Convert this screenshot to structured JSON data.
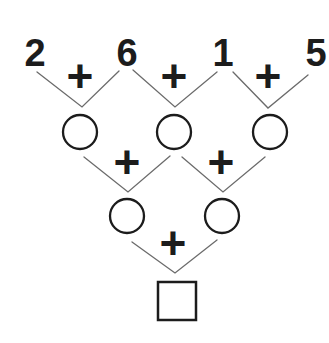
{
  "diagram": {
    "kind": "addition-pyramid-puzzle",
    "operator": "+",
    "row1": {
      "values": [
        "2",
        "6",
        "1",
        "5"
      ]
    },
    "row2": {
      "node_shape": "circle",
      "count": 3,
      "values": [
        "",
        "",
        ""
      ]
    },
    "row3": {
      "node_shape": "circle",
      "count": 2,
      "values": [
        "",
        ""
      ]
    },
    "row4": {
      "node_shape": "square",
      "count": 1,
      "values": [
        ""
      ]
    },
    "colors": {
      "ink": "#1c1c1c",
      "line": "#6b6b6b",
      "background": "#ffffff"
    }
  }
}
